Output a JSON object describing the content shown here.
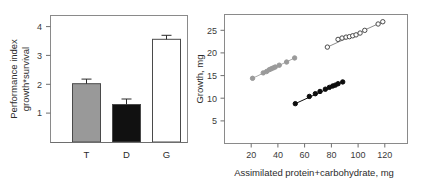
{
  "figure": {
    "panels": [
      "bar",
      "scatter"
    ]
  },
  "chart_data": [
    {
      "type": "bar",
      "panel": "left",
      "title": "",
      "xlabel": "",
      "ylabel": "Performance index growth*survival",
      "ylabel_line1": "Performance index",
      "ylabel_line2": "growth*survival",
      "categories": [
        "T",
        "D",
        "G"
      ],
      "values": [
        2.02,
        1.3,
        3.56
      ],
      "errors": [
        0.16,
        0.19,
        0.14
      ],
      "ylim": [
        0,
        4.4
      ],
      "yticks": [
        1,
        2,
        3,
        4
      ],
      "ytick_labels": [
        "1",
        "2",
        "3",
        "4"
      ],
      "grid": false,
      "legend": "none",
      "bar_colors": [
        "#999999",
        "#111111",
        "#ffffff"
      ],
      "bar_edge_color": "#4a4a4a",
      "frame": true
    },
    {
      "type": "scatter",
      "panel": "right",
      "title": "",
      "xlabel": "Assimilated protein+carbohydrate, mg",
      "ylabel": "Growth, mg",
      "xlim": [
        0,
        137
      ],
      "ylim": [
        0,
        28.5
      ],
      "xticks": [
        20,
        40,
        60,
        80,
        100,
        120
      ],
      "xtick_labels": [
        "20",
        "40",
        "60",
        "80",
        "100",
        "120"
      ],
      "yticks": [
        5,
        10,
        15,
        20,
        25
      ],
      "ytick_labels": [
        "5",
        "10",
        "15",
        "20",
        "25"
      ],
      "grid": false,
      "legend": "none",
      "series": [
        {
          "name": "gray-series",
          "marker": "filled-circle",
          "color": "#9a9a9a",
          "line_color": "#a8a8a8",
          "x": [
            21.0,
            29.0,
            31.5,
            33.5,
            35.0,
            36.5,
            38.0,
            41.0,
            46.5,
            52.5
          ],
          "y": [
            14.4,
            15.6,
            15.9,
            16.3,
            16.5,
            16.7,
            16.9,
            17.3,
            18.0,
            18.9
          ]
        },
        {
          "name": "open-series",
          "marker": "open-circle",
          "color": "#4a4a4a",
          "line_color": "#8a8a8a",
          "x": [
            77.0,
            85.0,
            88.0,
            91.0,
            93.5,
            96.0,
            98.5,
            101.5,
            105.0,
            115.0,
            118.5
          ],
          "y": [
            21.3,
            23.0,
            23.3,
            23.5,
            23.6,
            23.8,
            24.0,
            24.4,
            25.0,
            26.4,
            26.9
          ]
        },
        {
          "name": "black-series",
          "marker": "filled-circle",
          "color": "#0d0d0d",
          "line_color": "#0d0d0d",
          "x": [
            53.0,
            63.5,
            68.0,
            71.5,
            75.5,
            78.5,
            81.0,
            83.0,
            85.0,
            88.5
          ],
          "y": [
            8.8,
            10.4,
            11.0,
            11.5,
            12.0,
            12.4,
            12.7,
            12.9,
            13.2,
            13.6
          ]
        }
      ]
    }
  ]
}
